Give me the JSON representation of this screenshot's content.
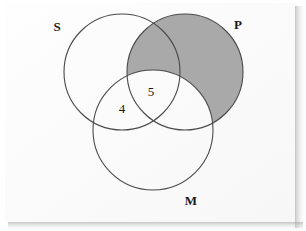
{
  "figure": {
    "type": "venn-diagram",
    "background_color": "#ffffff",
    "paper_color": "#fdfdfd",
    "outline_color": "#4a4a4a",
    "text_color": "#1a1a1a",
    "shade_color": "#a9a9a9"
  },
  "sets": [
    {
      "id": "S",
      "label": "S",
      "label_x": 57,
      "label_y": 31,
      "cx": 122,
      "cy": 72,
      "r": 58,
      "shaded": false
    },
    {
      "id": "P",
      "label": "P",
      "label_x": 238,
      "label_y": 29,
      "cx": 185,
      "cy": 72,
      "r": 58,
      "shaded": true
    },
    {
      "id": "M",
      "label": "M",
      "label_x": 191,
      "label_y": 205,
      "cx": 153,
      "cy": 130,
      "r": 60,
      "shaded": false
    }
  ],
  "regions": [
    {
      "id": "S-and-M-only",
      "label": "4",
      "x": 122,
      "y": 113,
      "sets": [
        "S",
        "M"
      ]
    },
    {
      "id": "S-and-P-and-M",
      "label": "5",
      "x": 151,
      "y": 96,
      "sets": [
        "S",
        "P",
        "M"
      ]
    }
  ],
  "shading": {
    "description": "P minus M",
    "color": "#a9a9a9"
  }
}
